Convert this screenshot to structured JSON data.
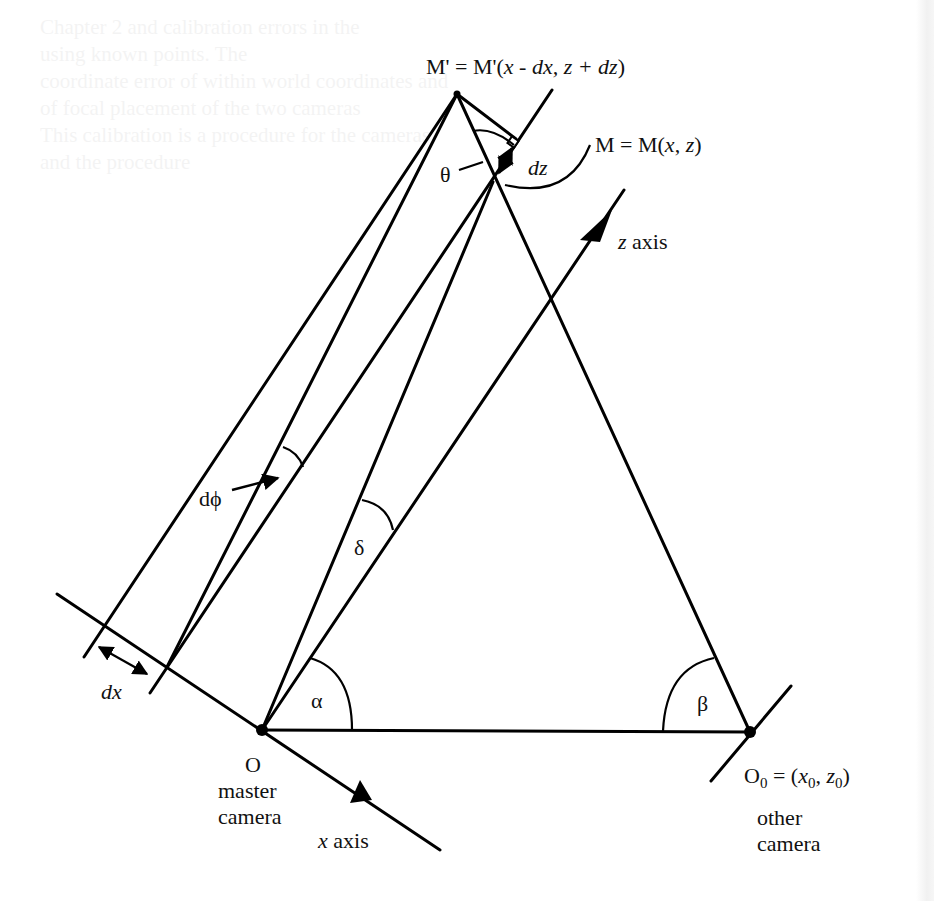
{
  "figure": {
    "points": {
      "M_prime": {
        "label_prefix": "M' = M'(",
        "label_body": "x - dx, z + dz",
        "label_suffix": ")"
      },
      "M": {
        "label": "M = M(x, z)",
        "label_prefix": "M = M(",
        "label_x": "x",
        "label_sep": ", ",
        "label_z": "z",
        "label_suffix": ")"
      },
      "O": {
        "label": "O",
        "caption_line1": "master",
        "caption_line2": "camera"
      },
      "O0": {
        "label_main": "O",
        "label_sub": "0",
        "label_rest_prefix": " = (",
        "label_x": "x",
        "label_x_sub": "0",
        "label_sep": ", ",
        "label_z": "z",
        "label_z_sub": "0",
        "label_suffix": ")",
        "caption_line1": "other",
        "caption_line2": "camera"
      }
    },
    "axes": {
      "z_axis": {
        "var": "z",
        "word": " axis"
      },
      "x_axis": {
        "var": "x",
        "word": " axis"
      }
    },
    "angles": {
      "theta": "θ",
      "dphi": "dϕ",
      "delta": "δ",
      "alpha": "α",
      "beta": "β"
    },
    "increments": {
      "dx": "dx",
      "dz": "dz"
    },
    "colors": {
      "ink": "#000000",
      "paper": "#ffffff"
    }
  },
  "background_bleed_text": [
    "                         Chapter 2  and calibration errors in the",
    "          using known points. The",
    "                 coordinate error of within world coordinates and",
    "                     of focal placement of the two cameras",
    "                  This calibration is a procedure for the cameras",
    "                           and the procedure"
  ]
}
